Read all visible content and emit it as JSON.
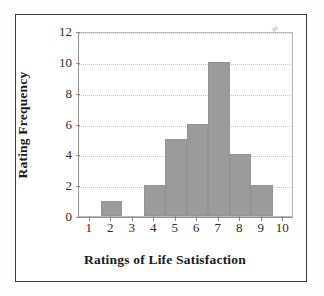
{
  "chart_data": {
    "type": "bar",
    "title": "",
    "subtitle": "",
    "xlabel": "Ratings of Life Satisfaction",
    "ylabel": "Rating Frequency",
    "categories": [
      "1",
      "2",
      "3",
      "4",
      "5",
      "6",
      "7",
      "8",
      "9",
      "10"
    ],
    "values": [
      0,
      1,
      0,
      2,
      5,
      6,
      10,
      4,
      2,
      0
    ],
    "x_tick_labels": [
      "1",
      "2",
      "3",
      "4",
      "5",
      "6",
      "7",
      "8",
      "9",
      "10"
    ],
    "y_tick_labels": [
      "0",
      "2",
      "4",
      "6",
      "8",
      "10",
      "12"
    ],
    "y_tick_values": [
      0,
      2,
      4,
      6,
      8,
      10,
      12
    ],
    "xlim": [
      0.5,
      10.5
    ],
    "ylim": [
      0,
      12
    ],
    "grid": "horizontal-dotted",
    "legend": "none",
    "bar_color": "#9b9b9b",
    "bar_edge_color": "#949494",
    "grid_color": "#c9c9c9",
    "axis_color": "#8f8f8f",
    "plot_border_color": "#b9b9b9",
    "frame_color": "#3b3b3b",
    "background_color": "#ffffff",
    "text_color": "#1a1a1a",
    "annotations": []
  }
}
